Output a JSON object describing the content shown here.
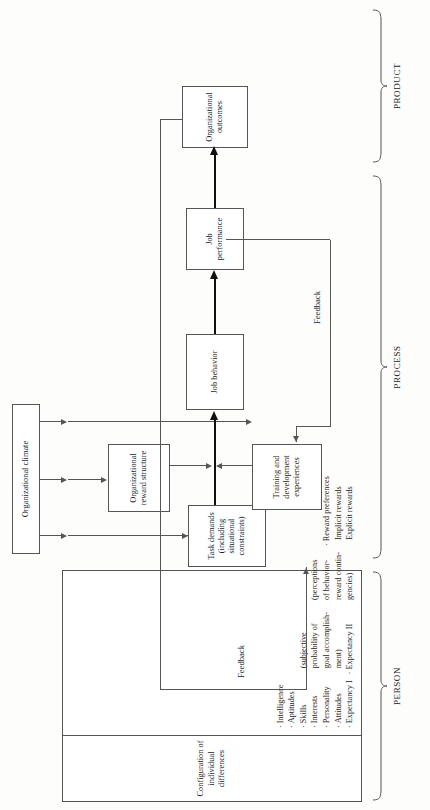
{
  "figure": {
    "type": "flowchart",
    "orientation": "rotated-90-ccw",
    "boxes": {
      "organizational_climate": "Organizational climate",
      "individual_differences_title": "Configuration of\nindividual differences",
      "task_demands": "Task demands\n(including\nsituational\nconstraints)",
      "organizational_reward_structure": "Organizational\nreward structure",
      "training_development": "Training and\ndevelopment\nexperiences",
      "job_behavior": "Job behavior",
      "job_performance": "Job\nperformance",
      "organizational_outcomes": "Organizational\noutcomes"
    },
    "box_labels": {
      "organizational_climate": "Organizational climate",
      "task_demands_l1": "Task demands",
      "task_demands_l2": "(including",
      "task_demands_l3": "situational",
      "task_demands_l4": "constraints)",
      "reward_structure_l1": "Organizational",
      "reward_structure_l2": "reward structure",
      "training_l1": "Training and",
      "training_l2": "development",
      "training_l3": "experiences",
      "job_behavior": "Job behavior",
      "job_performance_l1": "Job",
      "job_performance_l2": "performance",
      "outcomes_l1": "Organizational",
      "outcomes_l2": "outcomes",
      "config_l1": "Configuration of",
      "config_l2": "individual differences"
    },
    "individual_differences": {
      "column_1": [
        {
          "text": "Intelligence",
          "bullet": true,
          "sub": false
        },
        {
          "text": "Aptitudes",
          "bullet": true,
          "sub": false
        },
        {
          "text": "Skills",
          "bullet": true,
          "sub": false
        },
        {
          "text": "Interests",
          "bullet": true,
          "sub": false
        },
        {
          "text": "Personality",
          "bullet": true,
          "sub": false
        },
        {
          "text": "Attitudes",
          "bullet": true,
          "sub": false
        },
        {
          "text": "Expectancy I",
          "bullet": true,
          "sub": false
        },
        {
          "text": "(subjective",
          "bullet": false,
          "sub": true
        },
        {
          "text": "probability of",
          "bullet": false,
          "sub": true
        },
        {
          "text": "goal accomplish-",
          "bullet": false,
          "sub": true
        },
        {
          "text": "ment)",
          "bullet": false,
          "sub": true
        },
        {
          "text": "Expectancy II",
          "bullet": true,
          "sub": false
        },
        {
          "text": "(perceptions",
          "bullet": false,
          "sub": true
        },
        {
          "text": "of behavior-",
          "bullet": false,
          "sub": true
        },
        {
          "text": "reward contin-",
          "bullet": false,
          "sub": true
        },
        {
          "text": "gencies)",
          "bullet": false,
          "sub": true
        },
        {
          "text": "Reward preferences",
          "bullet": true,
          "sub": false
        },
        {
          "text": "Implicit rewards",
          "bullet": false,
          "sub": true
        },
        {
          "text": "Explicit rewards",
          "bullet": false,
          "sub": true
        }
      ]
    },
    "annotations": {
      "feedback_left": "Feedback",
      "feedback_right": "Feedback"
    },
    "sections": {
      "product": "PRODUCT",
      "process": "PROCESS",
      "person": "PERSON"
    },
    "colors": {
      "line": "#555555",
      "thick_line": "#111111",
      "box_fill": "#ffffff",
      "background": "#fdfdfc",
      "text": "#1a1a1a"
    }
  }
}
